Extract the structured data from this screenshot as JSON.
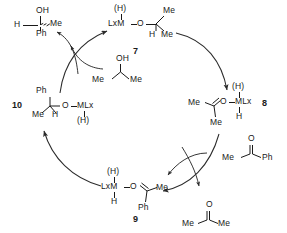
{
  "diagram": {
    "type": "catalytic-cycle",
    "cycle_direction": "clockwise"
  },
  "species": {
    "product_alcohol": {
      "name": "1-phenylethanol",
      "oh": "OH",
      "h": "H",
      "me": "Me",
      "ph": "Ph"
    },
    "seven": {
      "label": "7",
      "hydride": "(H)",
      "metal": "LxM",
      "oxygen": "O",
      "me_top": "Me",
      "h": "H",
      "me_bottom": "Me"
    },
    "isopropanol": {
      "name": "isopropanol",
      "oh": "OH",
      "me_left": "Me",
      "me_right": "Me"
    },
    "eight": {
      "label": "8",
      "hydride": "(H)",
      "metal": "MLx",
      "oxygen": "O",
      "h": "H",
      "me_left": "Me",
      "me_bottom": "Me"
    },
    "acetophenone": {
      "name": "acetophenone",
      "o": "O",
      "me": "Me",
      "ph": "Ph"
    },
    "nine": {
      "label": "9",
      "hydride": "(H)",
      "metal": "LxM",
      "oxygen": "O",
      "h": "H",
      "me": "Me",
      "ph": "Ph"
    },
    "acetone": {
      "name": "acetone",
      "o": "O",
      "me_left": "Me",
      "me_right": "Me"
    },
    "ten": {
      "label": "10",
      "hydride": "(H)",
      "metal": "MLx",
      "oxygen": "O",
      "ph": "Ph",
      "me": "Me",
      "h": "H"
    }
  },
  "colors": {
    "ink": "#1a1a1a",
    "background": "#ffffff"
  }
}
